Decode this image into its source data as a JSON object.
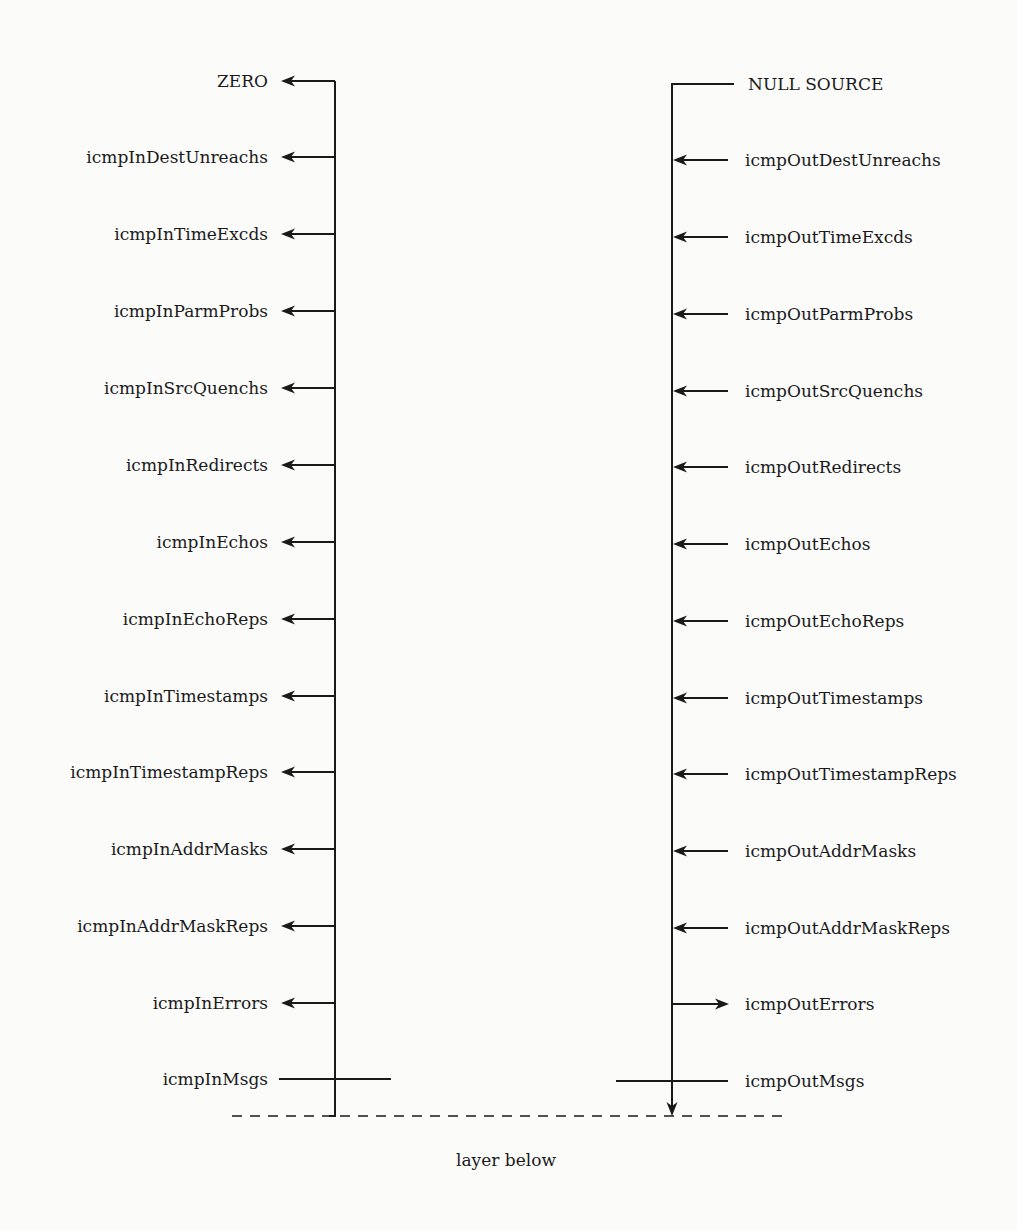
{
  "diagram": {
    "left_column": {
      "trunk_x": 335,
      "trunk_top": 81,
      "trunk_bottom": 1116,
      "items": [
        {
          "label": "ZERO",
          "y": 81,
          "kind": "arrow-out",
          "is_top": true
        },
        {
          "label": "icmpInDestUnreachs",
          "y": 157,
          "kind": "arrow-out"
        },
        {
          "label": "icmpInTimeExcds",
          "y": 234,
          "kind": "arrow-out"
        },
        {
          "label": "icmpInParmProbs",
          "y": 311,
          "kind": "arrow-out"
        },
        {
          "label": "icmpInSrcQuenchs",
          "y": 388,
          "kind": "arrow-out"
        },
        {
          "label": "icmpInRedirects",
          "y": 465,
          "kind": "arrow-out"
        },
        {
          "label": "icmpInEchos",
          "y": 542,
          "kind": "arrow-out"
        },
        {
          "label": "icmpInEchoReps",
          "y": 619,
          "kind": "arrow-out"
        },
        {
          "label": "icmpInTimestamps",
          "y": 696,
          "kind": "arrow-out"
        },
        {
          "label": "icmpInTimestampReps",
          "y": 772,
          "kind": "arrow-out"
        },
        {
          "label": "icmpInAddrMasks",
          "y": 849,
          "kind": "arrow-out"
        },
        {
          "label": "icmpInAddrMaskReps",
          "y": 926,
          "kind": "arrow-out"
        },
        {
          "label": "icmpInErrors",
          "y": 1003,
          "kind": "arrow-out"
        },
        {
          "label": "icmpInMsgs",
          "y": 1079,
          "kind": "counter-crossing"
        }
      ]
    },
    "right_column": {
      "trunk_x": 672,
      "trunk_top": 84,
      "trunk_bottom": 1116,
      "items": [
        {
          "label": "NULL SOURCE",
          "y": 84,
          "kind": "source",
          "is_top": true
        },
        {
          "label": "icmpOutDestUnreachs",
          "y": 160,
          "kind": "arrow-in"
        },
        {
          "label": "icmpOutTimeExcds",
          "y": 237,
          "kind": "arrow-in"
        },
        {
          "label": "icmpOutParmProbs",
          "y": 314,
          "kind": "arrow-in"
        },
        {
          "label": "icmpOutSrcQuenchs",
          "y": 391,
          "kind": "arrow-in"
        },
        {
          "label": "icmpOutRedirects",
          "y": 467,
          "kind": "arrow-in"
        },
        {
          "label": "icmpOutEchos",
          "y": 544,
          "kind": "arrow-in"
        },
        {
          "label": "icmpOutEchoReps",
          "y": 621,
          "kind": "arrow-in"
        },
        {
          "label": "icmpOutTimestamps",
          "y": 698,
          "kind": "arrow-in"
        },
        {
          "label": "icmpOutTimestampReps",
          "y": 774,
          "kind": "arrow-in"
        },
        {
          "label": "icmpOutAddrMasks",
          "y": 851,
          "kind": "arrow-in"
        },
        {
          "label": "icmpOutAddrMaskReps",
          "y": 928,
          "kind": "arrow-in"
        },
        {
          "label": "icmpOutErrors",
          "y": 1004,
          "kind": "arrow-out"
        },
        {
          "label": "icmpOutMsgs",
          "y": 1081,
          "kind": "counter-crossing"
        }
      ]
    },
    "layer_boundary": {
      "label": "layer below",
      "y": 1116,
      "x_start": 232,
      "x_end": 785,
      "style": "dashed"
    },
    "colors": {
      "background": "#fbfbfa",
      "ink": "#1a1a1a"
    }
  }
}
